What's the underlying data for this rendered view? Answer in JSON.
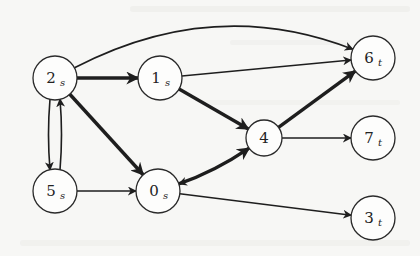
{
  "diagram": {
    "type": "directed-graph",
    "colors": {
      "background": "#f7f7f5",
      "stroke": "#1e1e1e",
      "node_fill": "#fdfdfc"
    },
    "nodes": [
      {
        "id": "2s",
        "label": "2",
        "sub": "s",
        "x": 55,
        "y": 78,
        "r": 22
      },
      {
        "id": "1s",
        "label": "1",
        "sub": "s",
        "x": 160,
        "y": 78,
        "r": 22
      },
      {
        "id": "6t",
        "label": "6",
        "sub": "t",
        "x": 373,
        "y": 58,
        "r": 22
      },
      {
        "id": "4",
        "label": "4",
        "sub": "",
        "x": 264,
        "y": 138,
        "r": 18
      },
      {
        "id": "7t",
        "label": "7",
        "sub": "t",
        "x": 373,
        "y": 138,
        "r": 22
      },
      {
        "id": "5s",
        "label": "5",
        "sub": "s",
        "x": 55,
        "y": 191,
        "r": 22
      },
      {
        "id": "0s",
        "label": "0",
        "sub": "s",
        "x": 158,
        "y": 191,
        "r": 22
      },
      {
        "id": "3t",
        "label": "3",
        "sub": "t",
        "x": 373,
        "y": 218,
        "r": 22
      }
    ],
    "edges": [
      {
        "from": "2s",
        "to": "1s",
        "weight": "thick"
      },
      {
        "from": "2s",
        "to": "6t",
        "weight": "thin",
        "curve": "arc-up"
      },
      {
        "from": "2s",
        "to": "0s",
        "weight": "thick"
      },
      {
        "from": "2s",
        "to": "5s",
        "weight": "thin",
        "curve": "left"
      },
      {
        "from": "5s",
        "to": "2s",
        "weight": "thin",
        "curve": "right"
      },
      {
        "from": "1s",
        "to": "6t",
        "weight": "thin"
      },
      {
        "from": "1s",
        "to": "4",
        "weight": "thick"
      },
      {
        "from": "5s",
        "to": "0s",
        "weight": "thin"
      },
      {
        "from": "0s",
        "to": "4",
        "weight": "thick",
        "curve": "lower"
      },
      {
        "from": "4",
        "to": "0s",
        "weight": "thin",
        "curve": "upper"
      },
      {
        "from": "0s",
        "to": "3t",
        "weight": "thin"
      },
      {
        "from": "4",
        "to": "6t",
        "weight": "thick"
      },
      {
        "from": "4",
        "to": "7t",
        "weight": "thin"
      }
    ]
  }
}
